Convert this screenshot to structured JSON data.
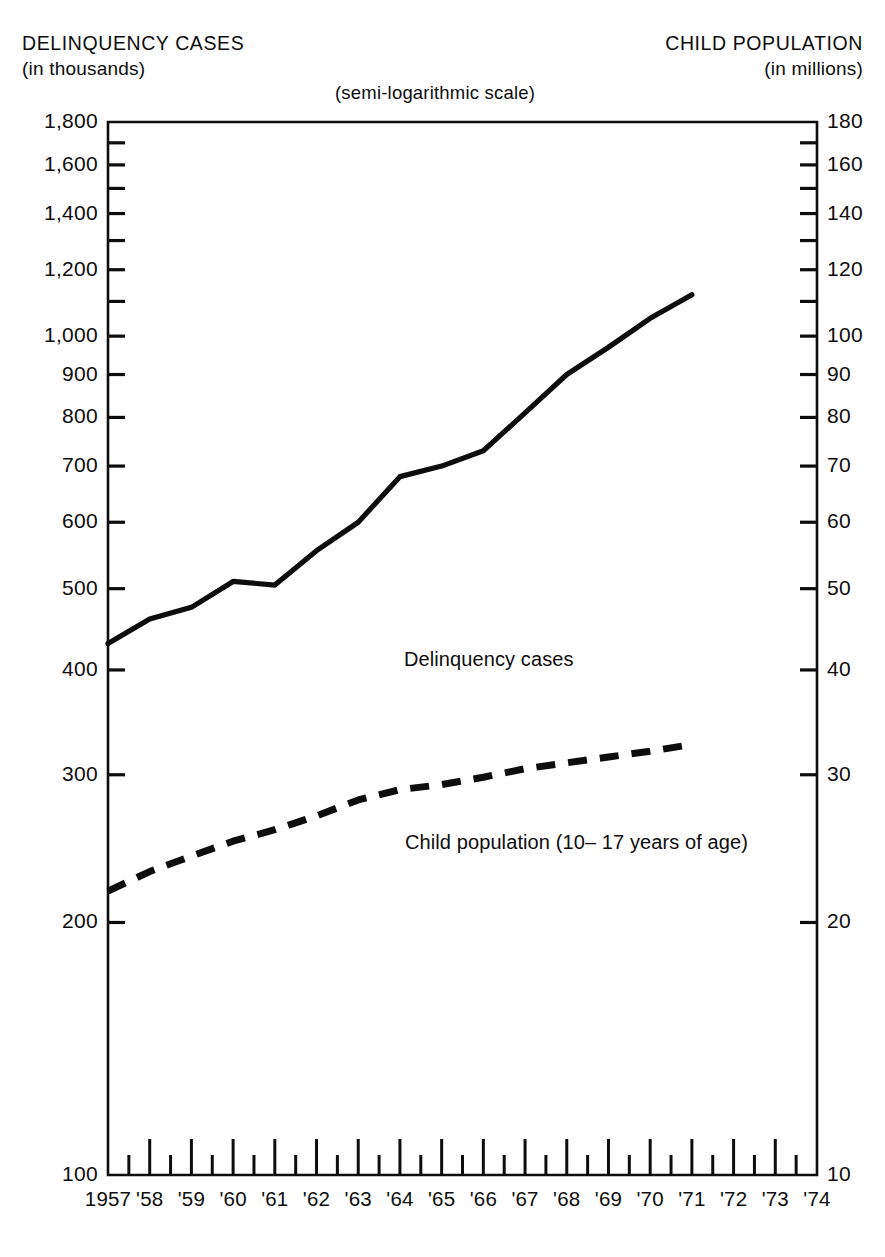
{
  "header": {
    "left_title": "DELINQUENCY CASES",
    "left_subtitle": "(in thousands)",
    "center_note": "(semi-logarithmic scale)",
    "right_title": "CHILD POPULATION",
    "right_subtitle": "(in millions)"
  },
  "chart_data": {
    "type": "line",
    "title": "",
    "subtitle": "(semi-logarithmic scale)",
    "scale": "semi-logarithmic",
    "grid": false,
    "legend_position": "inline-annotation",
    "xlabel": "",
    "x": [
      "1957",
      "'58",
      "'59",
      "'60",
      "'61",
      "'62",
      "'63",
      "'64",
      "'65",
      "'66",
      "'67",
      "'68",
      "'69",
      "'70",
      "'71",
      "'72",
      "'73",
      "'74"
    ],
    "x_tick_labels": [
      "1957",
      "'58",
      "'59",
      "'60",
      "'61",
      "'62",
      "'63",
      "'64",
      "'65",
      "'66",
      "'67",
      "'68",
      "'69",
      "'70",
      "'71",
      "'72",
      "'73",
      "'74"
    ],
    "xlim": [
      "1957",
      "1974"
    ],
    "left_axis": {
      "label": "DELINQUENCY CASES",
      "units": "in thousands",
      "ticks": [
        100,
        200,
        300,
        400,
        500,
        600,
        700,
        800,
        900,
        1000,
        1200,
        1400,
        1600,
        1800
      ],
      "tick_labels": [
        "100",
        "200",
        "300",
        "400",
        "500",
        "600",
        "700",
        "800",
        "900",
        "1,000",
        "1,200",
        "1,400",
        "1,600",
        "1,800"
      ],
      "ylim": [
        100,
        1800
      ]
    },
    "right_axis": {
      "label": "CHILD POPULATION",
      "units": "in millions",
      "ticks": [
        10,
        20,
        30,
        40,
        50,
        60,
        70,
        80,
        90,
        100,
        120,
        140,
        160,
        180
      ],
      "tick_labels": [
        "10",
        "20",
        "30",
        "40",
        "50",
        "60",
        "70",
        "80",
        "90",
        "100",
        "120",
        "140",
        "160",
        "180"
      ],
      "ylim": [
        10,
        180
      ]
    },
    "series": [
      {
        "name": "Delinquency cases",
        "annotation": "Delinquency cases",
        "style": "solid",
        "axis": "left",
        "units": "thousands",
        "x": [
          1957,
          1958,
          1959,
          1960,
          1961,
          1962,
          1963,
          1964,
          1965,
          1966,
          1967,
          1968,
          1969,
          1970,
          1971
        ],
        "values": [
          430,
          460,
          475,
          510,
          505,
          555,
          600,
          680,
          700,
          730,
          810,
          900,
          970,
          1050,
          1120
        ]
      },
      {
        "name": "Child population (10-17 years of age)",
        "annotation": "Child population (10– 17 years of age)",
        "style": "dashed",
        "axis": "right",
        "units": "millions",
        "x": [
          1957,
          1958,
          1959,
          1960,
          1961,
          1962,
          1963,
          1964,
          1965,
          1966,
          1967,
          1968,
          1969,
          1970,
          1971
        ],
        "values": [
          21.8,
          23.0,
          24.0,
          25.0,
          25.8,
          26.8,
          28.0,
          28.8,
          29.2,
          29.8,
          30.5,
          31.0,
          31.5,
          32.0,
          32.6
        ]
      }
    ]
  },
  "colors": {
    "ink": "#0d0d0d",
    "background": "#ffffff"
  }
}
